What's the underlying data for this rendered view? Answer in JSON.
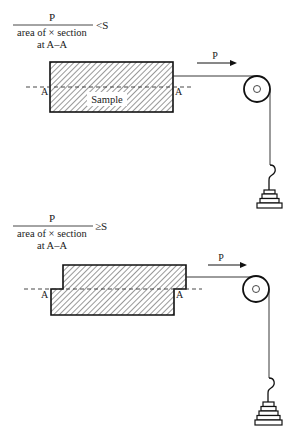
{
  "panels": [
    {
      "id": "top",
      "formula": {
        "numerator": "P",
        "denominator": "area of × section",
        "subscript": "at A–A",
        "relation": "<S"
      },
      "section_label_left": "A",
      "section_label_right": "A",
      "sample_label": "Sample",
      "force_label": "P"
    },
    {
      "id": "bottom",
      "formula": {
        "numerator": "P",
        "denominator": "area of × section",
        "subscript": "at A–A",
        "relation": "≥S"
      },
      "section_label_left": "A",
      "section_label_right": "A",
      "force_label": "P"
    }
  ],
  "colors": {
    "ink": "#1a1a1a",
    "background": "#ffffff"
  }
}
